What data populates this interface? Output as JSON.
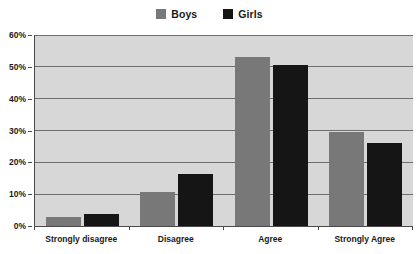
{
  "chart_data": {
    "type": "bar",
    "title": "",
    "subtitle": "",
    "xlabel": "",
    "ylabel": "",
    "categories": [
      "Strongly disagree",
      "Disagree",
      "Agree",
      "Strongly Agree"
    ],
    "series": [
      {
        "name": "Boys",
        "color": "#787878",
        "values": [
          2.7,
          10.8,
          53.2,
          29.5
        ]
      },
      {
        "name": "Girls",
        "color": "#151515",
        "values": [
          3.8,
          16.3,
          50.6,
          26.0
        ]
      }
    ],
    "ylim": [
      0,
      60
    ],
    "yticks": [
      0,
      10,
      20,
      30,
      40,
      50,
      60
    ],
    "ytick_labels": [
      "0%",
      "10%",
      "20%",
      "30%",
      "40%",
      "50%",
      "60%"
    ],
    "grid": true,
    "grid_axis": "y",
    "legend_position": "top-center",
    "plot_background": "#d7d7d7",
    "figure_background": "#ffffff",
    "axis_color": "#4a4a4a",
    "gridline_color": "#6e6e6e"
  },
  "legend": {
    "entries": [
      {
        "label": "Boys",
        "swatch_color": "#787878"
      },
      {
        "label": "Girls",
        "swatch_color": "#151515"
      }
    ]
  },
  "axes": {
    "y": {
      "labels": [
        "60%",
        "50%",
        "40%",
        "30%",
        "20%",
        "10%",
        "0%"
      ]
    },
    "x": {
      "labels": [
        "Strongly disagree",
        "Disagree",
        "Agree",
        "Strongly Agree"
      ]
    }
  }
}
